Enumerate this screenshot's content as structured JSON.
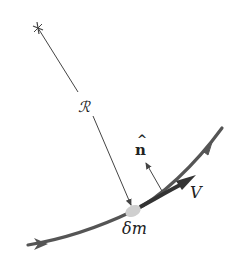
{
  "diagram": {
    "labels": {
      "radius": "ℛ",
      "normal": "n̂",
      "normal_base": "n",
      "normal_hat": "^",
      "velocity": "V",
      "element": "δm"
    },
    "colors": {
      "streamline": "#555555",
      "radius_line": "#444444",
      "element": "#cfcfcf",
      "text": "#222222"
    },
    "elements": [
      {
        "name": "center-of-curvature",
        "x": 38,
        "y": 28
      },
      {
        "name": "fluid-element",
        "x": 133,
        "y": 211
      },
      {
        "name": "streamline-start",
        "x": 28,
        "y": 245
      },
      {
        "name": "streamline-end",
        "x": 222,
        "y": 128
      }
    ]
  }
}
